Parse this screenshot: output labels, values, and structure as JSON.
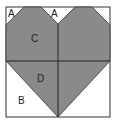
{
  "diagram": {
    "colors": {
      "heart": "#8a8a8a",
      "background": "#ffffff",
      "line": "#222222"
    },
    "labels": {
      "a_left": "A",
      "a_center": "A",
      "c": "C",
      "d": "D",
      "b": "B"
    }
  }
}
